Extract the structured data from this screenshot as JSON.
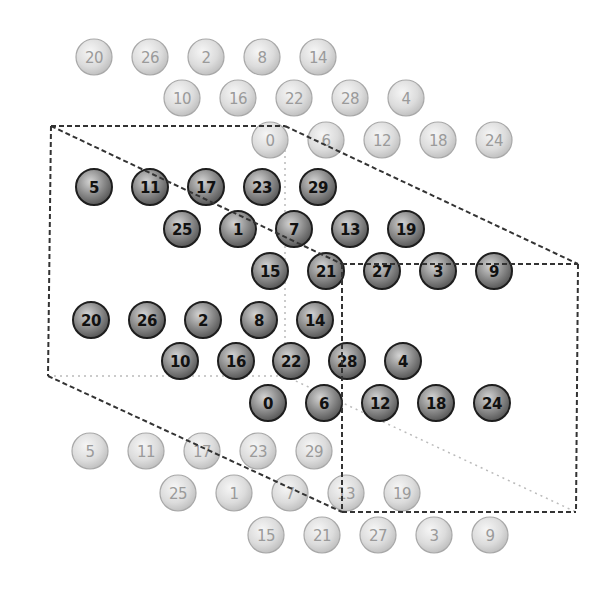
{
  "diagram": {
    "colors": {
      "dark_ball_stroke": "#1e1e1e",
      "dark_ball_fill_center": "#d0d0d0",
      "dark_ball_fill_edge": "#555555",
      "light_ball_stroke": "#a8a8a8",
      "light_ball_fill_center": "#f4f4f4",
      "light_ball_fill_edge": "#bdbdbd",
      "box_edge": "#333333",
      "hidden_edge": "#bbbbbb"
    },
    "ball_radius": 18,
    "rows": [
      {
        "y": 57,
        "style": "light",
        "balls": [
          {
            "x": 94,
            "label": "20"
          },
          {
            "x": 150,
            "label": "26"
          },
          {
            "x": 206,
            "label": "2"
          },
          {
            "x": 262,
            "label": "8"
          },
          {
            "x": 318,
            "label": "14"
          }
        ]
      },
      {
        "y": 98,
        "style": "light",
        "balls": [
          {
            "x": 182,
            "label": "10"
          },
          {
            "x": 238,
            "label": "16"
          },
          {
            "x": 294,
            "label": "22"
          },
          {
            "x": 350,
            "label": "28"
          },
          {
            "x": 406,
            "label": "4"
          }
        ]
      },
      {
        "y": 140,
        "style": "light",
        "balls": [
          {
            "x": 270,
            "label": "0"
          },
          {
            "x": 326,
            "label": "6"
          },
          {
            "x": 382,
            "label": "12"
          },
          {
            "x": 438,
            "label": "18"
          },
          {
            "x": 494,
            "label": "24"
          }
        ]
      },
      {
        "y": 187,
        "style": "dark",
        "balls": [
          {
            "x": 94,
            "label": "5"
          },
          {
            "x": 150,
            "label": "11"
          },
          {
            "x": 206,
            "label": "17"
          },
          {
            "x": 262,
            "label": "23"
          },
          {
            "x": 318,
            "label": "29"
          }
        ]
      },
      {
        "y": 229,
        "style": "dark",
        "balls": [
          {
            "x": 182,
            "label": "25"
          },
          {
            "x": 238,
            "label": "1"
          },
          {
            "x": 294,
            "label": "7"
          },
          {
            "x": 350,
            "label": "13"
          },
          {
            "x": 406,
            "label": "19"
          }
        ]
      },
      {
        "y": 271,
        "style": "dark",
        "balls": [
          {
            "x": 270,
            "label": "15"
          },
          {
            "x": 326,
            "label": "21"
          },
          {
            "x": 382,
            "label": "27"
          },
          {
            "x": 438,
            "label": "3"
          },
          {
            "x": 494,
            "label": "9"
          }
        ]
      },
      {
        "y": 320,
        "style": "dark",
        "balls": [
          {
            "x": 91,
            "label": "20"
          },
          {
            "x": 147,
            "label": "26"
          },
          {
            "x": 203,
            "label": "2"
          },
          {
            "x": 259,
            "label": "8"
          },
          {
            "x": 315,
            "label": "14"
          }
        ]
      },
      {
        "y": 361,
        "style": "dark",
        "balls": [
          {
            "x": 180,
            "label": "10"
          },
          {
            "x": 236,
            "label": "16"
          },
          {
            "x": 291,
            "label": "22"
          },
          {
            "x": 347,
            "label": "28"
          },
          {
            "x": 403,
            "label": "4"
          }
        ]
      },
      {
        "y": 403,
        "style": "dark",
        "balls": [
          {
            "x": 268,
            "label": "0"
          },
          {
            "x": 324,
            "label": "6"
          },
          {
            "x": 380,
            "label": "12"
          },
          {
            "x": 436,
            "label": "18"
          },
          {
            "x": 492,
            "label": "24"
          }
        ]
      },
      {
        "y": 451,
        "style": "light",
        "balls": [
          {
            "x": 90,
            "label": "5"
          },
          {
            "x": 146,
            "label": "11"
          },
          {
            "x": 202,
            "label": "17"
          },
          {
            "x": 258,
            "label": "23"
          },
          {
            "x": 314,
            "label": "29"
          }
        ]
      },
      {
        "y": 493,
        "style": "light",
        "balls": [
          {
            "x": 178,
            "label": "25"
          },
          {
            "x": 234,
            "label": "1"
          },
          {
            "x": 290,
            "label": "7"
          },
          {
            "x": 346,
            "label": "13"
          },
          {
            "x": 402,
            "label": "19"
          }
        ]
      },
      {
        "y": 535,
        "style": "light",
        "balls": [
          {
            "x": 266,
            "label": "15"
          },
          {
            "x": 322,
            "label": "21"
          },
          {
            "x": 378,
            "label": "27"
          },
          {
            "x": 434,
            "label": "3"
          },
          {
            "x": 490,
            "label": "9"
          }
        ]
      }
    ],
    "box_edges_visible": [
      [
        51,
        126,
        285,
        126
      ],
      [
        285,
        126,
        578,
        264
      ],
      [
        51,
        126,
        342,
        264
      ],
      [
        342,
        264,
        578,
        264
      ],
      [
        51,
        126,
        48,
        376
      ],
      [
        342,
        264,
        342,
        512
      ],
      [
        578,
        264,
        576,
        512
      ],
      [
        48,
        376,
        342,
        512
      ],
      [
        342,
        512,
        576,
        512
      ]
    ],
    "box_edges_hidden": [
      [
        285,
        126,
        285,
        376
      ],
      [
        48,
        376,
        285,
        376
      ],
      [
        285,
        376,
        576,
        512
      ]
    ]
  }
}
